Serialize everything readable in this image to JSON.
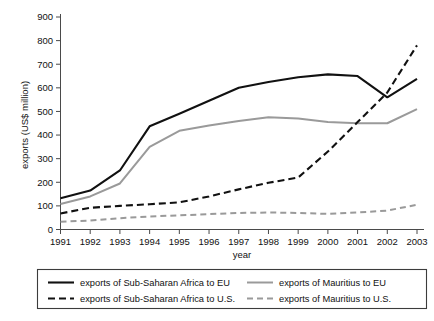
{
  "chart_data": {
    "type": "line",
    "title": "",
    "xlabel": "year",
    "ylabel": "exports (US$ million)",
    "x": [
      1991,
      1992,
      1993,
      1994,
      1995,
      1996,
      1997,
      1998,
      1999,
      2000,
      2001,
      2002,
      2003
    ],
    "xtick_labels": [
      "1991",
      "1992",
      "1993",
      "1994",
      "1995",
      "1996",
      "1997",
      "1998",
      "1999",
      "2000",
      "2001",
      "2002",
      "2003"
    ],
    "ytick_labels": [
      "0",
      "100",
      "200",
      "300",
      "400",
      "500",
      "600",
      "700",
      "800",
      "900"
    ],
    "yticks": [
      0,
      100,
      200,
      300,
      400,
      500,
      600,
      700,
      800,
      900
    ],
    "ylim": [
      0,
      900
    ],
    "xlim": [
      1991,
      2003
    ],
    "grid": false,
    "legend_position": "below",
    "series": [
      {
        "name": "exports of Sub-Saharan Africa to EU",
        "color": "#111111",
        "style": "solid",
        "values": [
          132,
          165,
          250,
          437,
          490,
          545,
          600,
          625,
          645,
          657,
          650,
          560,
          638
        ]
      },
      {
        "name": "exports of Mauritius to EU",
        "color": "#9a9a9a",
        "style": "solid",
        "values": [
          108,
          140,
          195,
          350,
          418,
          440,
          460,
          475,
          470,
          455,
          450,
          450,
          510
        ]
      },
      {
        "name": "exports of Sub-Saharan Africa to U.S.",
        "color": "#111111",
        "style": "dashed",
        "values": [
          68,
          92,
          100,
          107,
          115,
          140,
          170,
          198,
          220,
          330,
          455,
          580,
          780
        ]
      },
      {
        "name": "exports of Mauritius to U.S.",
        "color": "#9a9a9a",
        "style": "dashed",
        "values": [
          33,
          38,
          48,
          55,
          60,
          65,
          70,
          72,
          70,
          66,
          72,
          80,
          105
        ]
      }
    ]
  },
  "legend": {
    "entries": [
      {
        "label": "exports of Sub-Saharan Africa to EU"
      },
      {
        "label": "exports of Mauritius to EU"
      },
      {
        "label": "exports of Sub-Saharan Africa to U.S."
      },
      {
        "label": "exports of Mauritius to U.S."
      }
    ]
  }
}
